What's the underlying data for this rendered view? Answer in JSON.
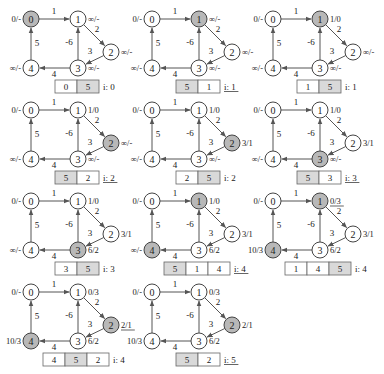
{
  "graph": {
    "nodes": [
      {
        "id": "0",
        "x": 31,
        "y": 19,
        "label_side": "left"
      },
      {
        "id": "1",
        "x": 78,
        "y": 19,
        "label_side": "right"
      },
      {
        "id": "2",
        "x": 111,
        "y": 52,
        "label_side": "right"
      },
      {
        "id": "3",
        "x": 78,
        "y": 68,
        "label_side": "right"
      },
      {
        "id": "4",
        "x": 31,
        "y": 68,
        "label_side": "left"
      }
    ],
    "edges": [
      {
        "from": "0",
        "to": "1",
        "weight": "1",
        "lx": 54,
        "ly": 14
      },
      {
        "from": "1",
        "to": "2",
        "weight": "2",
        "lx": 97,
        "ly": 32
      },
      {
        "from": "2",
        "to": "3",
        "weight": "3",
        "lx": 90,
        "ly": 54
      },
      {
        "from": "3",
        "to": "1",
        "weight": "-6",
        "lx": 69,
        "ly": 45
      },
      {
        "from": "3",
        "to": "4",
        "weight": "4",
        "lx": 54,
        "ly": 77
      },
      {
        "from": "4",
        "to": "0",
        "weight": "5",
        "lx": 37,
        "ly": 46
      }
    ]
  },
  "panels": [
    {
      "ox": 0,
      "oy": 0,
      "highlight": [
        "0"
      ],
      "labels": {
        "0": "0/-",
        "1": "∞/-",
        "2": "∞/-",
        "3": "∞/-",
        "4": "∞/-"
      },
      "underline_labels": [],
      "queue": [
        "0",
        "5"
      ],
      "shaded": [
        1
      ],
      "queue_left": 55,
      "i_label": "i: 0",
      "i_underline": false
    },
    {
      "ox": 121,
      "oy": 0,
      "highlight": [
        "1"
      ],
      "labels": {
        "0": "0/-",
        "1": "∞/-",
        "2": "∞/-",
        "3": "∞/-",
        "4": "∞/-"
      },
      "underline_labels": [],
      "queue": [
        "5",
        "1"
      ],
      "shaded": [
        0
      ],
      "queue_left": 55,
      "i_label": "i: 1",
      "i_underline": true
    },
    {
      "ox": 242,
      "oy": 0,
      "highlight": [
        "1"
      ],
      "labels": {
        "0": "0/-",
        "1": "1/0",
        "2": "∞/-",
        "3": "∞/-",
        "4": "∞/-"
      },
      "underline_labels": [],
      "queue": [
        "1",
        "5"
      ],
      "shaded": [
        1
      ],
      "queue_left": 55,
      "i_label": "i: 1",
      "i_underline": false
    },
    {
      "ox": 0,
      "oy": 91,
      "highlight": [
        "2"
      ],
      "labels": {
        "0": "0/-",
        "1": "1/0",
        "2": "∞/-",
        "3": "∞/-",
        "4": "∞/-"
      },
      "underline_labels": [],
      "queue": [
        "5",
        "2"
      ],
      "shaded": [
        0
      ],
      "queue_left": 55,
      "i_label": "i: 2",
      "i_underline": true
    },
    {
      "ox": 121,
      "oy": 91,
      "highlight": [
        "2"
      ],
      "labels": {
        "0": "0/-",
        "1": "1/0",
        "2": "3/1",
        "3": "∞/-",
        "4": "∞/-"
      },
      "underline_labels": [],
      "queue": [
        "2",
        "5"
      ],
      "shaded": [
        1
      ],
      "queue_left": 55,
      "i_label": "i: 2",
      "i_underline": false
    },
    {
      "ox": 242,
      "oy": 91,
      "highlight": [
        "3"
      ],
      "labels": {
        "0": "0/-",
        "1": "1/0",
        "2": "3/1",
        "3": "∞/-",
        "4": "∞/-"
      },
      "underline_labels": [],
      "queue": [
        "5",
        "3"
      ],
      "shaded": [
        0
      ],
      "queue_left": 55,
      "i_label": "i: 3",
      "i_underline": true
    },
    {
      "ox": 0,
      "oy": 182,
      "highlight": [
        "3"
      ],
      "labels": {
        "0": "0/-",
        "1": "1/0",
        "2": "3/1",
        "3": "6/2",
        "4": "∞/-"
      },
      "underline_labels": [],
      "queue": [
        "3",
        "5"
      ],
      "shaded": [
        1
      ],
      "queue_left": 55,
      "i_label": "i: 3",
      "i_underline": false
    },
    {
      "ox": 121,
      "oy": 182,
      "highlight": [
        "1",
        "4"
      ],
      "labels": {
        "0": "0/-",
        "1": "1/0",
        "2": "3/1",
        "3": "6/2",
        "4": "∞/-"
      },
      "underline_labels": [],
      "queue": [
        "5",
        "1",
        "4"
      ],
      "shaded": [
        0
      ],
      "queue_left": 43,
      "i_label": "i: 4",
      "i_underline": true
    },
    {
      "ox": 242,
      "oy": 182,
      "highlight": [
        "1",
        "4"
      ],
      "labels": {
        "0": "0/-",
        "1": "0/3",
        "2": "3/1",
        "3": "6/2",
        "4": "10/3"
      },
      "underline_labels": [
        "1"
      ],
      "queue": [
        "1",
        "4",
        "5"
      ],
      "shaded": [
        2
      ],
      "queue_left": 43,
      "i_label": "i: 4",
      "i_underline": false
    },
    {
      "ox": 0,
      "oy": 273,
      "highlight": [
        "2",
        "4"
      ],
      "labels": {
        "0": "0/-",
        "1": "0/3",
        "2": "2/1",
        "3": "6/2",
        "4": "10/3"
      },
      "underline_labels": [
        "2"
      ],
      "queue": [
        "4",
        "5",
        "2"
      ],
      "shaded": [
        1
      ],
      "queue_left": 43,
      "i_label": "i: 4",
      "i_underline": false
    },
    {
      "ox": 121,
      "oy": 273,
      "highlight": [
        "2"
      ],
      "labels": {
        "0": "0/-",
        "1": "0/3",
        "2": "2/1",
        "3": "6/2",
        "4": "10/3"
      },
      "underline_labels": [],
      "queue": [
        "5",
        "2"
      ],
      "shaded": [
        0
      ],
      "queue_left": 55,
      "i_label": "i: 5",
      "i_underline": true
    }
  ],
  "style": {
    "node_radius": 8,
    "node_fill": "#ffffff",
    "highlight_fill": "#b8b8b8",
    "stroke": "#444444",
    "edge_color": "#555555",
    "text_color": "#222222",
    "queue_shade": "#d9d9d9",
    "cell_w": 22,
    "cell_h": 13,
    "queue_top": 80
  }
}
